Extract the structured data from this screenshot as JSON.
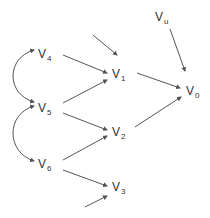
{
  "diagram": {
    "type": "directed-graph",
    "edge_color": "#555555",
    "text_color": "#333333",
    "nodes": [
      {
        "id": "V4",
        "base": "V",
        "sub": "4",
        "x": 38,
        "y": 48
      },
      {
        "id": "V5",
        "base": "V",
        "sub": "5",
        "x": 38,
        "y": 102
      },
      {
        "id": "V6",
        "base": "V",
        "sub": "6",
        "x": 38,
        "y": 158
      },
      {
        "id": "V1",
        "base": "V",
        "sub": "1",
        "x": 112,
        "y": 68
      },
      {
        "id": "V2",
        "base": "V",
        "sub": "2",
        "x": 112,
        "y": 126
      },
      {
        "id": "V3",
        "base": "V",
        "sub": "3",
        "x": 112,
        "y": 181
      },
      {
        "id": "V0",
        "base": "V",
        "sub": "0",
        "x": 186,
        "y": 85
      },
      {
        "id": "Vu",
        "base": "V",
        "sub": "u",
        "x": 155,
        "y": 11
      }
    ],
    "edges": [
      {
        "from": "unlabeled-top",
        "to": "V1",
        "x1": 93,
        "y1": 35,
        "x2": 117,
        "y2": 55,
        "curved": false
      },
      {
        "from": "V4",
        "to": "V1",
        "x1": 63,
        "y1": 55,
        "x2": 107,
        "y2": 73,
        "curved": false
      },
      {
        "from": "V5",
        "to": "V1",
        "x1": 63,
        "y1": 103,
        "x2": 107,
        "y2": 80,
        "curved": false
      },
      {
        "from": "V5",
        "to": "V2",
        "x1": 63,
        "y1": 113,
        "x2": 107,
        "y2": 130,
        "curved": false
      },
      {
        "from": "V6",
        "to": "V2",
        "x1": 63,
        "y1": 160,
        "x2": 107,
        "y2": 136,
        "curved": false
      },
      {
        "from": "V6",
        "to": "V3",
        "x1": 63,
        "y1": 170,
        "x2": 107,
        "y2": 186,
        "curved": false
      },
      {
        "from": "unlabeled-bottom",
        "to": "V3",
        "x1": 85,
        "y1": 207,
        "x2": 107,
        "y2": 196,
        "curved": false
      },
      {
        "from": "V1",
        "to": "V0",
        "x1": 137,
        "y1": 73,
        "x2": 180,
        "y2": 88,
        "curved": false
      },
      {
        "from": "V2",
        "to": "V0",
        "x1": 135,
        "y1": 127,
        "x2": 181,
        "y2": 97,
        "curved": false
      },
      {
        "from": "Vu",
        "to": "V0",
        "x1": 170,
        "y1": 29,
        "x2": 185,
        "y2": 71,
        "curved": false
      }
    ],
    "bidirected_arcs": [
      {
        "between": [
          "V4",
          "V5"
        ],
        "path": "M34 50 C 6 58, 6 94, 34 102"
      },
      {
        "between": [
          "V5",
          "V6"
        ],
        "path": "M34 106 C 6 114, 6 152, 34 161"
      }
    ]
  }
}
